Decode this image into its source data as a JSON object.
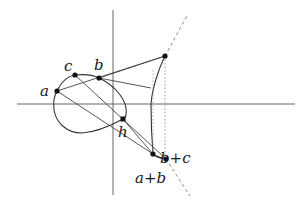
{
  "figure": {
    "width": 308,
    "height": 209,
    "colors": {
      "curve": "#333333",
      "axis": "#555555",
      "line": "#444444",
      "point": "#111111",
      "dashed": "#888888"
    }
  },
  "axes": {
    "horizontal": {
      "x1": 17,
      "y1": 104,
      "x2": 295,
      "y2": 104
    },
    "vertical": {
      "x1": 113,
      "y1": 10,
      "x2": 113,
      "y2": 195
    }
  },
  "points": [
    {
      "id": "a",
      "label": "a",
      "x": 57,
      "y": 91,
      "lx": 40,
      "ly": 96
    },
    {
      "id": "c",
      "label": "c",
      "x": 75,
      "y": 75,
      "lx": 64,
      "ly": 71
    },
    {
      "id": "b",
      "label": "b",
      "x": 99,
      "y": 78,
      "lx": 94,
      "ly": 70
    },
    {
      "id": "h",
      "label": "h",
      "x": 123,
      "y": 119,
      "lx": 118,
      "ly": 137
    },
    {
      "id": "top",
      "label": "",
      "x": 165,
      "y": 56
    },
    {
      "id": "bc",
      "label": "b+c",
      "x": 153,
      "y": 154,
      "lx": 160,
      "ly": 163
    },
    {
      "id": "ab",
      "label": "a+b",
      "x": 166,
      "y": 159,
      "lx": 135,
      "ly": 183
    }
  ]
}
